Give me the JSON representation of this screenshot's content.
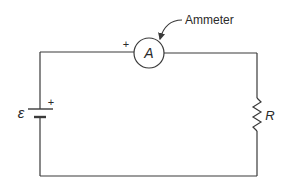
{
  "diagram": {
    "type": "circuit",
    "components": {
      "ammeter": {
        "symbol": "A",
        "callout": "Ammeter",
        "polarity": "+"
      },
      "battery": {
        "symbol": "ε",
        "polarity": "+"
      },
      "resistor": {
        "symbol": "R"
      }
    },
    "colors": {
      "line": "#3a3a3a",
      "text": "#2a2a2a",
      "background": "#ffffff"
    }
  }
}
